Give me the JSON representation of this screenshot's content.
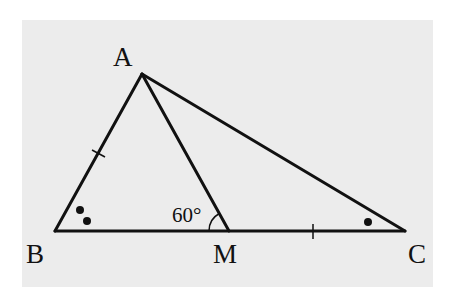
{
  "diagram": {
    "type": "triangle",
    "background_color": "#ececec",
    "line_color": "#111111",
    "vertices": {
      "A": {
        "label": "A",
        "x": 142,
        "y": 74
      },
      "B": {
        "label": "B",
        "x": 55,
        "y": 231
      },
      "M": {
        "label": "M",
        "x": 229,
        "y": 231
      },
      "C": {
        "label": "C",
        "x": 405,
        "y": 231
      }
    },
    "segments": [
      "AB",
      "AC",
      "BC",
      "AM"
    ],
    "angle_annotation": {
      "at": "M",
      "between": [
        "B",
        "A"
      ],
      "label": "60°"
    },
    "equal_marks": {
      "segments": [
        "AB",
        "MC"
      ],
      "mark": "single tick"
    },
    "angle_marks": [
      {
        "at": "B",
        "mark": "two dots"
      },
      {
        "at": "C",
        "mark": "one dot"
      }
    ]
  }
}
